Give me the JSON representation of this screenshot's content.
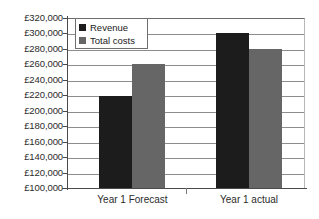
{
  "chart_data": {
    "type": "bar",
    "title": "",
    "subtitle": "",
    "xlabel": "",
    "ylabel": "",
    "categories": [
      "Year 1 Forecast",
      "Year 1 actual"
    ],
    "series": [
      {
        "name": "Revenue",
        "color": "#1c1c1c",
        "values": [
          219000,
          300000
        ]
      },
      {
        "name": "Total costs",
        "color": "#666666",
        "values": [
          260000,
          280000
        ]
      }
    ],
    "ylim": [
      100000,
      320000
    ],
    "ytick_step": 20000,
    "ytick_labels": [
      "£320,000",
      "£300,000",
      "£280,000",
      "£260,000",
      "£240,000",
      "£220,000",
      "£200,000",
      "£180,000",
      "£160,000",
      "£140,000",
      "£120,000",
      "£100,000"
    ],
    "ytick_values": [
      320000,
      300000,
      280000,
      260000,
      240000,
      220000,
      200000,
      180000,
      160000,
      140000,
      120000,
      100000
    ],
    "grid": true,
    "grid_axis": "y",
    "legend": {
      "position": "top-left-inside",
      "entries": [
        {
          "label": "Revenue",
          "color": "#1c1c1c"
        },
        {
          "label": "Total costs",
          "color": "#666666"
        }
      ]
    },
    "background_color": "#ffffff",
    "axis_color": "#4a4a4a",
    "gridline_color": "#8c8c8c"
  },
  "axis": {
    "y_ticks": [
      {
        "label": "£320,000",
        "value": 320000
      },
      {
        "label": "£300,000",
        "value": 300000
      },
      {
        "label": "£280,000",
        "value": 280000
      },
      {
        "label": "£260,000",
        "value": 260000
      },
      {
        "label": "£240,000",
        "value": 240000
      },
      {
        "label": "£220,000",
        "value": 220000
      },
      {
        "label": "£200,000",
        "value": 200000
      },
      {
        "label": "£180,000",
        "value": 180000
      },
      {
        "label": "£160,000",
        "value": 160000
      },
      {
        "label": "£140,000",
        "value": 140000
      },
      {
        "label": "£120,000",
        "value": 120000
      },
      {
        "label": "£100,000",
        "value": 100000
      }
    ],
    "x_ticks": [
      {
        "label": "Year 1 Forecast"
      },
      {
        "label": "Year 1 actual"
      }
    ]
  },
  "legend": {
    "entries": [
      {
        "label": "Revenue"
      },
      {
        "label": "Total costs"
      }
    ]
  }
}
